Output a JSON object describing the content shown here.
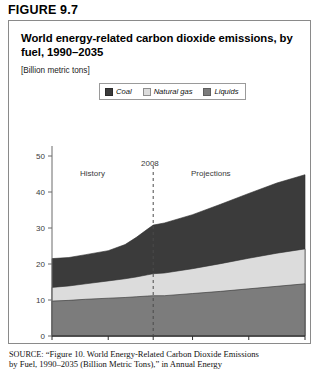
{
  "figure": {
    "number_label": "FIGURE 9.7",
    "title": "World energy-related carbon dioxide emissions, by fuel, 1990–2035",
    "units": "[Billion metric tons]"
  },
  "legend": {
    "position": "top-center",
    "items": [
      {
        "label": "Coal",
        "color": "#3b3b3b",
        "icon": "legend-swatch-icon"
      },
      {
        "label": "Natural gas",
        "color": "#dcdcdc",
        "icon": "legend-swatch-icon"
      },
      {
        "label": "Liquids",
        "color": "#7c7c7c",
        "icon": "legend-swatch-icon"
      }
    ]
  },
  "annotations": {
    "history": "History",
    "divider_year": "2008",
    "projections": "Projections"
  },
  "source": {
    "prefix": "SOURCE:",
    "line1": "“Figure 10. World Energy-Related Carbon Dioxide Emissions",
    "line2": "by Fuel, 1990–2035 (Billion Metric Tons),” in Annual Energy"
  },
  "chart_data": {
    "type": "area",
    "stacked": true,
    "title": "World energy-related carbon dioxide emissions, by fuel, 1990–2035",
    "subtitle": "[Billion metric tons]",
    "xlabel": "",
    "ylabel": "",
    "ylim": [
      0,
      50
    ],
    "yticks": [
      0,
      10,
      20,
      30,
      40,
      50
    ],
    "ytick_labels": [
      "0",
      "10",
      "20",
      "30",
      "40",
      "50"
    ],
    "xlim": [
      1990,
      2035
    ],
    "xticks": [
      1990,
      2000,
      2008,
      2015,
      2025,
      2035
    ],
    "xtick_labels": [
      "1990",
      "2000",
      "2008",
      "2015",
      "2025",
      "2035"
    ],
    "grid": false,
    "divider": {
      "x": 2008,
      "style": "dashed",
      "label": "2008"
    },
    "regions": [
      {
        "label": "History",
        "from": 1990,
        "to": 2008
      },
      {
        "label": "Projections",
        "from": 2008,
        "to": 2035
      }
    ],
    "x": [
      1990,
      1993,
      1996,
      2000,
      2003,
      2005,
      2007,
      2008,
      2010,
      2015,
      2020,
      2025,
      2030,
      2035
    ],
    "series": [
      {
        "name": "Liquids",
        "color": "#7c7c7c",
        "stack_order": 1,
        "values": [
          9.7,
          9.9,
          10.2,
          10.5,
          10.7,
          10.9,
          11.1,
          11.2,
          11.2,
          11.8,
          12.4,
          13.1,
          13.8,
          14.5
        ]
      },
      {
        "name": "Natural gas",
        "color": "#dcdcdc",
        "stack_order": 2,
        "values": [
          3.8,
          4.0,
          4.3,
          4.8,
          5.2,
          5.5,
          5.9,
          6.1,
          6.3,
          6.9,
          7.7,
          8.5,
          9.2,
          9.7
        ]
      },
      {
        "name": "Coal",
        "color": "#3b3b3b",
        "stack_order": 3,
        "values": [
          8.0,
          7.9,
          8.1,
          8.4,
          9.5,
          11.0,
          12.7,
          13.5,
          13.9,
          15.0,
          16.5,
          18.0,
          19.5,
          20.6
        ]
      }
    ],
    "cumulative_tops": {
      "Liquids": [
        9.7,
        9.9,
        10.2,
        10.5,
        10.7,
        10.9,
        11.1,
        11.2,
        11.2,
        11.8,
        12.4,
        13.1,
        13.8,
        14.5
      ],
      "Natural gas": [
        13.5,
        13.9,
        14.5,
        15.3,
        15.9,
        16.4,
        17.0,
        17.3,
        17.5,
        18.7,
        20.1,
        21.6,
        23.0,
        24.2
      ],
      "Coal": [
        21.5,
        21.8,
        22.6,
        23.7,
        25.4,
        27.4,
        29.7,
        30.8,
        31.4,
        33.7,
        36.6,
        39.6,
        42.5,
        44.8
      ]
    }
  }
}
